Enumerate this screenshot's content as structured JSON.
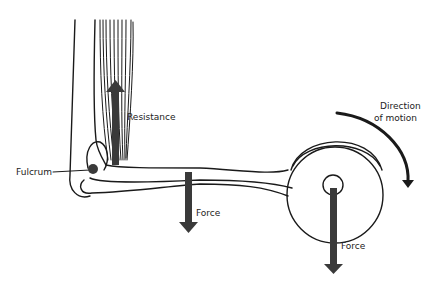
{
  "diagram": {
    "labels": {
      "resistance": "Resistance",
      "fulcrum": "Fulcrum",
      "force_forearm": "Force",
      "force_weight": "Force",
      "direction_line1": "Direction",
      "direction_line2": "of motion"
    },
    "colors": {
      "arrow": "#3a3a3a",
      "outline": "#1a1a1a",
      "background": "#ffffff"
    }
  }
}
